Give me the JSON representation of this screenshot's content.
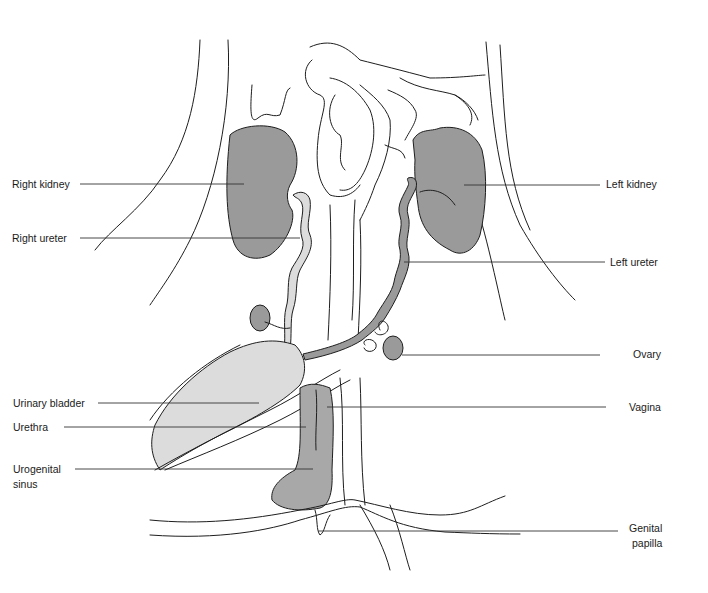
{
  "figure": {
    "type": "anatomical line drawing",
    "colors": {
      "kidney_fill": "#9a9a9a",
      "bladder_fill": "#dcdcdc",
      "ureter_right_fill": "#dcdcdc",
      "ureter_left_fill": "#9a9a9a",
      "sinus_fill": "#a8a8a8",
      "line": "#1e1e1e",
      "background": "#ffffff"
    }
  },
  "labels": {
    "left_side": [
      {
        "id": "right_kidney",
        "text": "Right kidney"
      },
      {
        "id": "right_ureter",
        "text": "Right ureter"
      },
      {
        "id": "urinary_bladder",
        "text": "Urinary bladder"
      },
      {
        "id": "urethra",
        "text": "Urethra"
      },
      {
        "id": "urogenital_sinus_1",
        "text": "Urogenital"
      },
      {
        "id": "urogenital_sinus_2",
        "text": "sinus"
      }
    ],
    "right_side": [
      {
        "id": "left_kidney",
        "text": "Left kidney"
      },
      {
        "id": "left_ureter",
        "text": "Left ureter"
      },
      {
        "id": "ovary",
        "text": "Ovary"
      },
      {
        "id": "vagina",
        "text": "Vagina"
      },
      {
        "id": "genital_papilla_1",
        "text": "Genital"
      },
      {
        "id": "genital_papilla_2",
        "text": "papilla"
      }
    ]
  }
}
